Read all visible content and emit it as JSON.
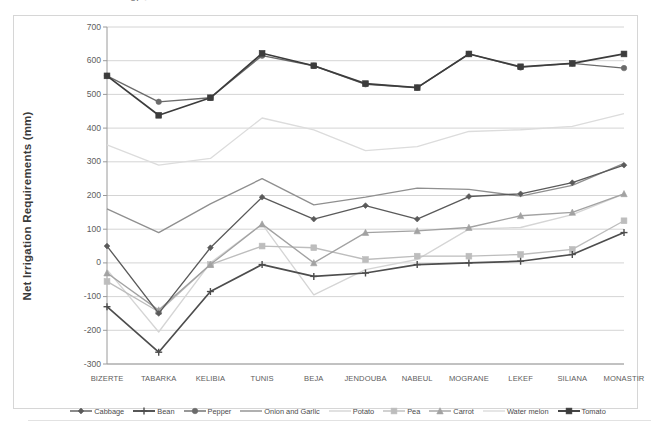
{
  "figure": {
    "top_artifact_text": "of  ●",
    "frame_border_color": "#d6d6d6",
    "background": "#ffffff"
  },
  "axes": {
    "y_title": "Net Irrigation Requirements  (mm)",
    "y_ticks": [
      "700",
      "600",
      "500",
      "400",
      "300",
      "200",
      "100",
      "0",
      "-100",
      "-200",
      "-300"
    ],
    "y_min": -300,
    "y_max": 700,
    "y_step": 100,
    "gridlines": true,
    "x_labels": [
      "BIZERTE",
      "TABARKA",
      "KELIBIA",
      "TUNIS",
      "BEJA",
      "JENDOUBA",
      "NABEUL",
      "MOGRANE",
      "LEKEF",
      "SILIANA",
      "MONASTIR"
    ]
  },
  "legend": {
    "position": "bottom",
    "entries": [
      {
        "label": "Cabbage",
        "color": "#5a5a5a",
        "marker": "diamond"
      },
      {
        "label": "Bean",
        "color": "#4d4d4d",
        "marker": "plus"
      },
      {
        "label": "Pepper",
        "color": "#6b6b6b",
        "marker": "circle"
      },
      {
        "label": "Onion and Garlic",
        "color": "#8f8f8f",
        "marker": "line"
      },
      {
        "label": "Potato",
        "color": "#d5d5d5",
        "marker": "line"
      },
      {
        "label": "Pea",
        "color": "#bdbdbd",
        "marker": "square"
      },
      {
        "label": "Carrot",
        "color": "#a2a2a2",
        "marker": "triangle"
      },
      {
        "label": "Water melon",
        "color": "#dcdcdc",
        "marker": "line"
      },
      {
        "label": "Tomato",
        "color": "#3c3c3c",
        "marker": "square-filled"
      }
    ]
  },
  "chart_data": {
    "type": "line",
    "title": "",
    "subtitle": "",
    "xlabel": "",
    "ylabel": "Net Irrigation Requirements  (mm)",
    "ylim": [
      -300,
      700
    ],
    "ytick_step": 100,
    "grid": true,
    "legend_position": "bottom",
    "categories": [
      "BIZERTE",
      "TABARKA",
      "KELIBIA",
      "TUNIS",
      "BEJA",
      "JENDOUBA",
      "NABEUL",
      "MOGRANE",
      "LEKEF",
      "SILIANA",
      "MONASTIR"
    ],
    "series": [
      {
        "name": "Cabbage",
        "color": "#5a5a5a",
        "marker": "diamond",
        "values": [
          50,
          -150,
          45,
          195,
          130,
          170,
          130,
          197,
          205,
          238,
          290
        ]
      },
      {
        "name": "Bean",
        "color": "#4d4d4d",
        "marker": "plus",
        "values": [
          -130,
          -265,
          -85,
          -5,
          -40,
          -30,
          -5,
          0,
          5,
          25,
          90
        ]
      },
      {
        "name": "Pepper",
        "color": "#6b6b6b",
        "marker": "circle",
        "values": [
          555,
          478,
          490,
          615,
          585,
          530,
          520,
          620,
          580,
          592,
          578
        ]
      },
      {
        "name": "Onion and Garlic",
        "color": "#8f8f8f",
        "marker": "line",
        "values": [
          160,
          90,
          175,
          250,
          172,
          195,
          222,
          218,
          198,
          230,
          295
        ]
      },
      {
        "name": "Potato",
        "color": "#d5d5d5",
        "marker": "line",
        "values": [
          -20,
          -205,
          0,
          115,
          -95,
          -20,
          10,
          100,
          105,
          143,
          205
        ]
      },
      {
        "name": "Pea",
        "color": "#bdbdbd",
        "marker": "square",
        "values": [
          -55,
          -145,
          -5,
          50,
          45,
          10,
          20,
          20,
          25,
          40,
          125
        ]
      },
      {
        "name": "Carrot",
        "color": "#a2a2a2",
        "marker": "triangle",
        "values": [
          -30,
          -140,
          -5,
          115,
          0,
          90,
          95,
          105,
          140,
          150,
          205
        ]
      },
      {
        "name": "Water melon",
        "color": "#dcdcdc",
        "marker": "line",
        "values": [
          350,
          290,
          310,
          430,
          395,
          333,
          345,
          390,
          395,
          405,
          443
        ]
      },
      {
        "name": "Tomato",
        "color": "#3c3c3c",
        "marker": "square-filled",
        "values": [
          555,
          438,
          490,
          622,
          585,
          532,
          520,
          620,
          582,
          592,
          620
        ]
      }
    ]
  }
}
